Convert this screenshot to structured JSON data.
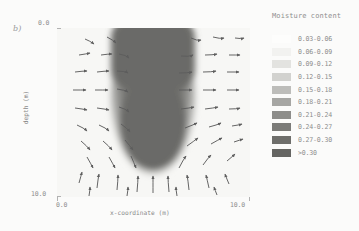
{
  "figure": {
    "panel_label": "b)"
  },
  "axes": {
    "x_axis_label": "x-coordinate (m)",
    "y_axis_label": "depth (m)",
    "x_ticks": [
      "0.0",
      "10.0"
    ],
    "y_ticks": [
      "0.0",
      "10.0"
    ]
  },
  "legend": {
    "title": "Moisture content",
    "entries": [
      {
        "label": "0.03-0.06",
        "color": "#fdfdfc"
      },
      {
        "label": "0.06-0.09",
        "color": "#f2f2f0"
      },
      {
        "label": "0.09-0.12",
        "color": "#e3e3e0"
      },
      {
        "label": "0.12-0.15",
        "color": "#d2d2cf"
      },
      {
        "label": "0.15-0.18",
        "color": "#bdbdba"
      },
      {
        "label": "0.18-0.21",
        "color": "#a6a6a3"
      },
      {
        "label": "0.21-0.24",
        "color": "#8d8d8a"
      },
      {
        "label": "0.24-0.27",
        "color": "#7b7b78"
      },
      {
        "label": "0.27-0.30",
        "color": "#6e6e6b"
      },
      {
        "label": ">0.30",
        "color": "#656562"
      }
    ]
  },
  "chart_data": {
    "type": "heatmap",
    "title": "",
    "subtitle": "",
    "xlabel": "x-coordinate (m)",
    "ylabel": "depth (m)",
    "xlim": [
      0.0,
      10.0
    ],
    "ylim": [
      10.0,
      0.0
    ],
    "grid": false,
    "legend_position": "right",
    "legend_title": "Moisture content",
    "colorbar_breaks": [
      0.03,
      0.06,
      0.09,
      0.12,
      0.15,
      0.18,
      0.21,
      0.24,
      0.27,
      0.3
    ],
    "field_description": "Moisture content plume centered near x=5.0 m extending from the surface (depth 0.0 m) down to about depth 8.5 m, widest between depth 1.5 and 6.5 m; plume core exceeds 0.30 moisture content and values decrease radially outward to below 0.06 at the domain edges.",
    "plume": {
      "center_x": 5.0,
      "top_depth": 0.0,
      "bottom_depth": 8.6,
      "half_width": 1.9,
      "core_value": 0.32
    },
    "overlay": {
      "type": "quiver",
      "description": "Velocity / flux vectors on a regular grid pointing inward toward the moisture plume; arrows on the left point right-to-left toward the plume, arrows on the right point left toward the plume, and arrows below the plume point upward toward the plume base.",
      "grid_nx": 11,
      "grid_ny": 10
    }
  }
}
